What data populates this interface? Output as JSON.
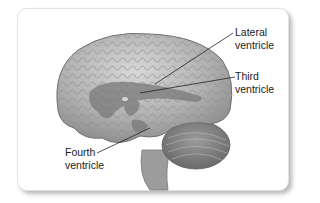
{
  "figure": {
    "labels": [
      {
        "id": "lateral",
        "line1": "Lateral",
        "line2": "ventricle"
      },
      {
        "id": "third",
        "line1": "Third",
        "line2": "ventricle"
      },
      {
        "id": "fourth",
        "line1": "Fourth",
        "line2": "ventricle"
      }
    ]
  },
  "colors": {
    "brain": "#a8a8a8",
    "ventricle": "#7a7a7a",
    "leader_line": "#222222",
    "card_border": "#e2e2e2",
    "shadow": "#b8b8b8"
  }
}
